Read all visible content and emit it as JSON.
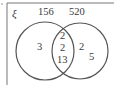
{
  "diagram": {
    "type": "venn",
    "universal_symbol": "ξ",
    "sets": [
      {
        "label": "156",
        "only": [
          "3"
        ]
      },
      {
        "label": "520",
        "only": [
          "2",
          "5"
        ]
      }
    ],
    "intersection": [
      "2",
      "2",
      "13"
    ],
    "colors": {
      "stroke": "#555555",
      "text": "#3a3a3a"
    }
  }
}
